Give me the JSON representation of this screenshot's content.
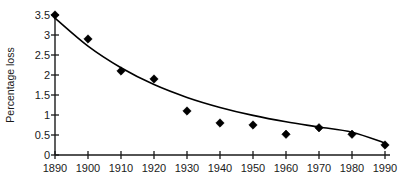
{
  "chart_data": {
    "type": "scatter",
    "title": "",
    "xlabel": "",
    "ylabel": "Percentage loss",
    "x": [
      1890,
      1900,
      1910,
      1920,
      1930,
      1940,
      1950,
      1960,
      1970,
      1980,
      1990
    ],
    "values": [
      3.5,
      2.9,
      2.1,
      1.9,
      1.1,
      0.8,
      0.75,
      0.52,
      0.68,
      0.52,
      0.25
    ],
    "series": [
      {
        "name": "Percentage loss",
        "marker": "filled-diamond",
        "values": [
          3.5,
          2.9,
          2.1,
          1.9,
          1.1,
          0.8,
          0.75,
          0.52,
          0.68,
          0.52,
          0.25
        ]
      },
      {
        "name": "fitted exponential decay curve",
        "marker": "none",
        "values": [
          3.42,
          2.72,
          2.18,
          1.76,
          1.44,
          1.19,
          0.99,
          0.83,
          0.7,
          0.57,
          0.3
        ]
      }
    ],
    "xticklabels": [
      "1890",
      "1900",
      "1910",
      "1920",
      "1930",
      "1940",
      "1950",
      "1960",
      "1970",
      "1980",
      "1990"
    ],
    "yticklabels": [
      "0",
      "0.5",
      "1",
      "1.5",
      "2",
      "2.5",
      "3",
      "3.5"
    ],
    "ytickvalues": [
      0,
      0.5,
      1,
      1.5,
      2,
      2.5,
      3,
      3.5
    ],
    "xlim": [
      1890,
      1990
    ],
    "ylim": [
      0,
      3.5
    ],
    "grid": false,
    "legend": false,
    "colors": {
      "marker": "#000000",
      "curve": "#000000",
      "axis": "#1a1a1a",
      "background": "#ffffff"
    }
  }
}
